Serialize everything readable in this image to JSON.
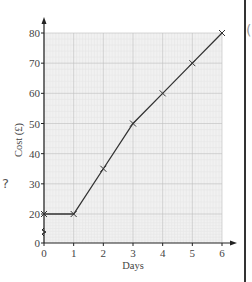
{
  "chart_data": {
    "type": "line",
    "title": "",
    "xlabel": "Days",
    "ylabel": "Cost (£)",
    "x": [
      0,
      1,
      2,
      3,
      4,
      5,
      6
    ],
    "series": [
      {
        "name": "Cost",
        "values": [
          20,
          20,
          35,
          50,
          60,
          70,
          80
        ],
        "marker": "x",
        "color": "#333333"
      }
    ],
    "x_ticks": [
      "0",
      "1",
      "2",
      "3",
      "4",
      "5",
      "6"
    ],
    "y_ticks": [
      "0",
      "20",
      "30",
      "40",
      "50",
      "60",
      "70",
      "80"
    ],
    "xlim": [
      0,
      6
    ],
    "ylim": [
      0,
      80
    ],
    "y_axis_break": [
      0,
      20
    ],
    "grid": true,
    "legend": "none"
  },
  "side_marks": {
    "question_mark": "?",
    "right_glyph": "("
  },
  "colors": {
    "grid_minor": "#e6e6e6",
    "grid_major": "#bdbdbd",
    "grid_bg": "#f1f1f1",
    "axis": "#222222",
    "line": "#333333"
  }
}
